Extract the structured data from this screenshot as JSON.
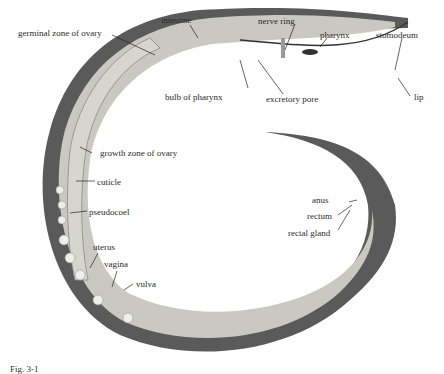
{
  "figure": {
    "caption": "Fig. 3-1",
    "colors": {
      "body_wall": "#5a5a5a",
      "interior": "#c9c9c2",
      "ovary": "#d6d6cf",
      "background": "#ffffff"
    }
  },
  "labels": {
    "germinal_zone": "germinal zone of ovary",
    "intestine": "intestine",
    "nerve_ring": "nerve ring",
    "pharynx": "pharynx",
    "stomodeum": "stomodeum",
    "bulb_of_pharynx": "bulb of pharynx",
    "excretory_pore": "excretory pore",
    "lip": "lip",
    "growth_zone": "growth zone of ovary",
    "cuticle": "cuticle",
    "pseudocoel": "pseudocoel",
    "uterus": "uterus",
    "vagina": "vagina",
    "vulva": "vulva",
    "anus": "anus",
    "rectum": "rectum",
    "rectal_gland": "rectal gland"
  }
}
